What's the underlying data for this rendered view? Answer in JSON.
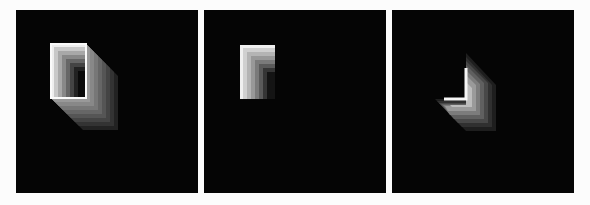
{
  "figure": {
    "background": "#fcfcfc",
    "panel_background": "#050505",
    "panels": [
      {
        "id": "panel-1",
        "left": 16,
        "description": "Extruded box: white rectangular front face with grey gradient extrusion toward lower right",
        "front_face": {
          "x": 35,
          "y": 34,
          "w": 35,
          "h": 54
        },
        "extrusion_offset": {
          "dx": 32,
          "dy": 32
        },
        "steps": 8
      },
      {
        "id": "panel-2",
        "left": 204,
        "description": "Rectangle with bright top/left edges fading toward lower right",
        "front_face": {
          "x": 36,
          "y": 35,
          "w": 35,
          "h": 54
        },
        "steps": 8
      },
      {
        "id": "panel-3",
        "left": 392,
        "description": "L-shaped bright corner with gradient spreading toward lower right",
        "corner": {
          "x": 74,
          "y": 89
        },
        "vertical_arm_top": 43,
        "horizontal_arm_left": 43,
        "extrusion_offset": {
          "dx": 30,
          "dy": 32
        },
        "steps": 8
      }
    ]
  }
}
